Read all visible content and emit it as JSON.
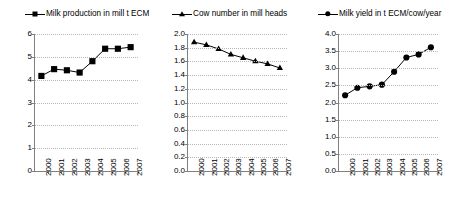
{
  "legend": {
    "entries": [
      {
        "label": "Milk production in mill t ECM",
        "marker": "square-marker-icon"
      },
      {
        "label": "Cow number in mill heads",
        "marker": "triangle-marker-icon"
      },
      {
        "label": "Milk yield in t ECM/cow/year",
        "marker": "circle-marker-icon"
      }
    ]
  },
  "chart_data": [
    {
      "type": "line",
      "title": "Milk production in mill t ECM",
      "xlabel": "",
      "ylabel": "",
      "categories": [
        "2000",
        "2001",
        "2002",
        "2003",
        "2004",
        "2005",
        "2006",
        "2007"
      ],
      "values": [
        4.15,
        4.45,
        4.4,
        4.3,
        4.8,
        5.35,
        5.35,
        5.42
      ],
      "ylim": [
        0,
        6
      ],
      "ytick_step": 1,
      "yticks": [
        "0",
        "1",
        "2",
        "3",
        "4",
        "5",
        "6"
      ],
      "marker": "square",
      "color": "#000000",
      "grid": true,
      "legend_position": "top"
    },
    {
      "type": "line",
      "title": "Cow number in mill heads",
      "xlabel": "",
      "ylabel": "",
      "categories": [
        "2000",
        "2001",
        "2002",
        "2003",
        "2004",
        "2005",
        "2006",
        "2007"
      ],
      "values": [
        1.88,
        1.84,
        1.78,
        1.7,
        1.65,
        1.6,
        1.56,
        1.5
      ],
      "ylim": [
        0.0,
        2.0
      ],
      "ytick_step": 0.2,
      "yticks": [
        "0.0",
        "0.2",
        "0.4",
        "0.6",
        "0.8",
        "1.0",
        "1.2",
        "1.4",
        "1.6",
        "1.8",
        "2.0"
      ],
      "marker": "triangle",
      "color": "#000000",
      "grid": true,
      "legend_position": "top"
    },
    {
      "type": "line",
      "title": "Milk yield in t ECM/cow/year",
      "xlabel": "",
      "ylabel": "",
      "categories": [
        "2000",
        "2001",
        "2002",
        "2003",
        "2004",
        "2005",
        "2006",
        "2007"
      ],
      "values": [
        2.2,
        2.42,
        2.46,
        2.51,
        2.89,
        3.31,
        3.4,
        3.61
      ],
      "ylim": [
        0.0,
        4.0
      ],
      "ytick_step": 0.5,
      "yticks": [
        "0.0",
        "0.5",
        "1.0",
        "1.5",
        "2.0",
        "2.5",
        "3.0",
        "3.5",
        "4.0"
      ],
      "marker": "circle",
      "color": "#000000",
      "grid": true,
      "legend_position": "top"
    }
  ]
}
